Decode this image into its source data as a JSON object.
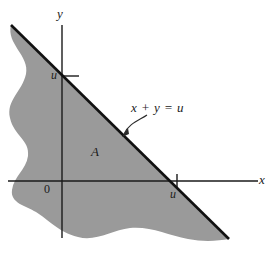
{
  "figure": {
    "type": "math-region-diagram",
    "background_color": "#ffffff",
    "region_fill_color": "#9a9a9a",
    "axis_color": "#1a1a1a",
    "line_color": "#111111",
    "axes": {
      "x_axis_label": "x",
      "y_axis_label": "y",
      "origin_label": "0"
    },
    "ticks": {
      "y_tick_label": "u",
      "x_tick_label": "u"
    },
    "annotations": {
      "region_label": "A",
      "line_equation": "x + y = u"
    },
    "caption": ""
  },
  "geometry": {
    "origin_px": {
      "x": 62,
      "y": 181
    },
    "x_axis_span_px": {
      "from": 8,
      "to": 258
    },
    "y_axis_span_px": {
      "from": 25,
      "to": 238
    },
    "u_on_y_axis_px": 76,
    "u_on_x_axis_px": 177,
    "diagonal_from_px": {
      "x": 11,
      "y": 25
    },
    "diagonal_to_px": {
      "x": 229,
      "y": 239
    },
    "arrow_tip_px": {
      "x": 123,
      "y": 136
    },
    "arrow_tail_px": {
      "x": 146,
      "y": 116
    }
  }
}
